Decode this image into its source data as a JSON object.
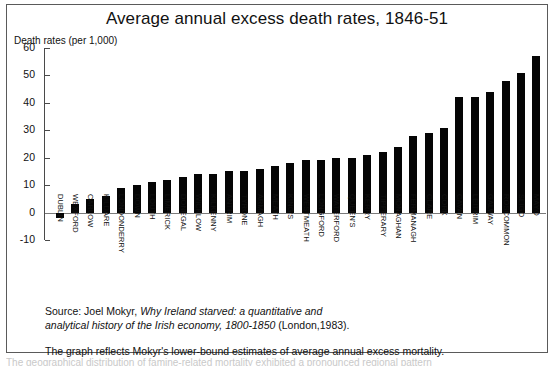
{
  "figure": {
    "title": "Average annual excess death rates, 1846-51",
    "y_axis_caption": "Death rates (per 1,000)",
    "source_line1_prefix": "Source: Joel Mokyr, ",
    "source_line1_italic": "Why Ireland starved: a quantitative and",
    "source_line2_italic": "analytical history of the Irish economy, 1800-1850",
    "source_line2_suffix": " (London,1983).",
    "source_line3": "The graph reflects Mokyr's lower-bound estimates of average annual excess mortality.",
    "clipped_text": "The geographical distribution of famine-related mortality exhibited a pronounced regional pattern"
  },
  "chart_data": {
    "type": "bar",
    "title": "Average annual excess death rates, 1846-51",
    "xlabel": "",
    "ylabel": "Death rates (per 1,000)",
    "ylim": [
      -10,
      60
    ],
    "ytick_step": 10,
    "yticks": [
      60,
      50,
      40,
      30,
      20,
      10,
      0,
      -10
    ],
    "grid": false,
    "legend": false,
    "bar_color": "#050505",
    "categories": [
      "DUBLIN",
      "WEXFORD",
      "CARLOW",
      "KILDARE",
      "LONDONDERRY",
      "DOWN",
      "LOUTH",
      "LIMERICK",
      "DONEGAL",
      "WICKLOW",
      "KILKENNY",
      "ANTRIM",
      "TYRONE",
      "ARMAGH",
      "MEATH",
      "KING'S",
      "WESTMEATH",
      "LONGFORD",
      "WATERFORD",
      "QUEEN'S",
      "KERRY",
      "TIPPERARY",
      "MONAGHAN",
      "FERMANAGH",
      "CLARE",
      "CORK",
      "CAVAN",
      "LEITRIM",
      "GALWAY",
      "ROSCOMMON",
      "SLIGO",
      "MAYO"
    ],
    "values": [
      -2,
      3,
      5,
      6,
      9,
      10,
      11,
      12,
      13,
      14,
      14,
      15,
      15,
      16,
      17,
      18,
      19,
      19,
      20,
      20,
      21,
      22,
      24,
      28,
      29,
      31,
      42,
      42,
      44,
      48,
      51,
      57
    ]
  }
}
